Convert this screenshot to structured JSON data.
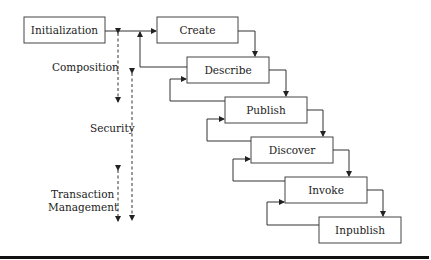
{
  "diagram": {
    "type": "flowchart",
    "boxes": [
      {
        "id": "initialization",
        "label": "Initialization",
        "x": 24,
        "y": 17,
        "w": 81,
        "h": 26
      },
      {
        "id": "create",
        "label": "Create",
        "x": 157,
        "y": 17,
        "w": 81,
        "h": 26
      },
      {
        "id": "describe",
        "label": "Describe",
        "x": 187,
        "y": 57,
        "w": 82,
        "h": 26
      },
      {
        "id": "publish",
        "label": "Publish",
        "x": 225,
        "y": 97,
        "w": 82,
        "h": 26
      },
      {
        "id": "discover",
        "label": "Discover",
        "x": 251,
        "y": 137,
        "w": 82,
        "h": 26
      },
      {
        "id": "invoke",
        "label": "Invoke",
        "x": 285,
        "y": 177,
        "w": 82,
        "h": 26
      },
      {
        "id": "inpublish",
        "label": "Inpublish",
        "x": 319,
        "y": 217,
        "w": 82,
        "h": 26
      }
    ],
    "side_labels": [
      {
        "id": "composition",
        "lines": [
          "Composition"
        ]
      },
      {
        "id": "security",
        "lines": [
          "Security"
        ]
      },
      {
        "id": "transaction-management",
        "lines": [
          "Transaction",
          "Management"
        ]
      }
    ]
  }
}
